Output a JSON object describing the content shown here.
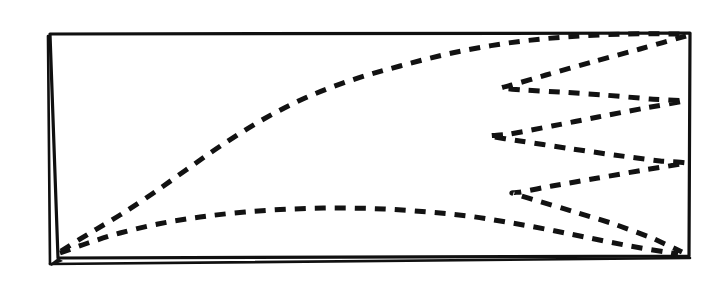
{
  "figure": {
    "description": "A hand-inked rectangular frame enclosing dashed curves: a rising arc and a flat curve from the lower-left corner, plus a serpentine zigzag on the right half.",
    "canvas": {
      "width": 724,
      "height": 290,
      "background": "#ffffff"
    },
    "ink_color": "#121212",
    "style": "hand-drawn ink on paper, scanned line art"
  },
  "frame": {
    "name": "bounding-rectangle",
    "stroke_color": "#101010",
    "stroke_width": 3.2,
    "double_left_edge": true,
    "corners": {
      "top_left": [
        50,
        34
      ],
      "top_right": [
        690,
        33
      ],
      "bottom_right": [
        689,
        256
      ],
      "bottom_left": [
        58,
        258
      ]
    },
    "outer_left_edge": {
      "top": [
        48,
        36
      ],
      "bottom": [
        50,
        264
      ]
    },
    "outer_bottom_edge": {
      "left": [
        50,
        264
      ],
      "right": [
        690,
        258
      ]
    }
  },
  "chart_data": {
    "type": "line",
    "subtitle": "",
    "xlabel": "",
    "ylabel": "",
    "grid": false,
    "legend": "none",
    "axis_box": {
      "x0": 50,
      "y0": 34,
      "x1": 690,
      "y1": 257
    },
    "xlim": [
      50,
      690
    ],
    "ylim": [
      34,
      257
    ],
    "note": "Coordinates are in screenshot pixel space; y increases downward.",
    "series": [
      {
        "name": "upper-arc-curve",
        "style": "dashed",
        "dash_pattern": [
          11,
          9
        ],
        "stroke_width": 5.0,
        "points": [
          [
            61,
            251
          ],
          [
            90,
            233
          ],
          [
            120,
            215
          ],
          [
            152,
            194
          ],
          [
            186,
            170
          ],
          [
            222,
            145
          ],
          [
            262,
            120
          ],
          [
            305,
            98
          ],
          [
            352,
            80
          ],
          [
            400,
            66
          ],
          [
            452,
            53
          ],
          [
            508,
            43
          ],
          [
            565,
            37
          ],
          [
            625,
            34
          ],
          [
            684,
            34
          ]
        ]
      },
      {
        "name": "lower-flat-curve",
        "style": "dashed",
        "dash_pattern": [
          11,
          9
        ],
        "stroke_width": 5.0,
        "points": [
          [
            60,
            253
          ],
          [
            88,
            243
          ],
          [
            120,
            233
          ],
          [
            158,
            224
          ],
          [
            200,
            217
          ],
          [
            245,
            212
          ],
          [
            292,
            209
          ],
          [
            338,
            208
          ],
          [
            384,
            209
          ],
          [
            428,
            212
          ],
          [
            468,
            216
          ],
          [
            506,
            222
          ],
          [
            545,
            229
          ],
          [
            585,
            237
          ],
          [
            630,
            246
          ],
          [
            678,
            254
          ]
        ]
      },
      {
        "name": "zigzag-serpentine",
        "style": "dashed",
        "dash_pattern": [
          11,
          9
        ],
        "stroke_width": 5.0,
        "vertices": [
          [
            686,
            36
          ],
          [
            501,
            88
          ],
          [
            684,
            101
          ],
          [
            489,
            136
          ],
          [
            686,
            163
          ],
          [
            512,
            193
          ],
          [
            682,
            252
          ]
        ],
        "points": [
          [
            686,
            36
          ],
          [
            640,
            49
          ],
          [
            592,
            62
          ],
          [
            546,
            75
          ],
          [
            512,
            85
          ],
          [
            501,
            88
          ],
          [
            523,
            90
          ],
          [
            560,
            92
          ],
          [
            604,
            95
          ],
          [
            650,
            99
          ],
          [
            684,
            101
          ],
          [
            645,
            108
          ],
          [
            598,
            117
          ],
          [
            552,
            126
          ],
          [
            510,
            134
          ],
          [
            489,
            136
          ],
          [
            520,
            141
          ],
          [
            566,
            148
          ],
          [
            614,
            155
          ],
          [
            660,
            161
          ],
          [
            686,
            163
          ],
          [
            644,
            170
          ],
          [
            598,
            178
          ],
          [
            552,
            186
          ],
          [
            521,
            192
          ],
          [
            512,
            193
          ],
          [
            538,
            201
          ],
          [
            575,
            212
          ],
          [
            614,
            224
          ],
          [
            652,
            238
          ],
          [
            682,
            252
          ]
        ]
      }
    ]
  },
  "elements": {
    "upper_arc_label": "upper dashed arc",
    "lower_curve_label": "lower dashed curve",
    "zigzag_label": "right-side dashed zigzag",
    "frame_label": "rectangular ink frame"
  }
}
